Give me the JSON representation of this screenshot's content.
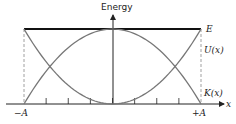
{
  "diagram": {
    "y_axis_label": "Energy",
    "x_axis_label": "x",
    "total_energy_label": "E",
    "potential_label": "U(x)",
    "kinetic_label": "K(x)",
    "left_bound_label": "−A",
    "right_bound_label": "+A",
    "tick_count_between_bounds": 7,
    "colors": {
      "axes": "#222222",
      "total_energy": "#111111",
      "curves": "#777777",
      "dashed": "#888888"
    }
  }
}
